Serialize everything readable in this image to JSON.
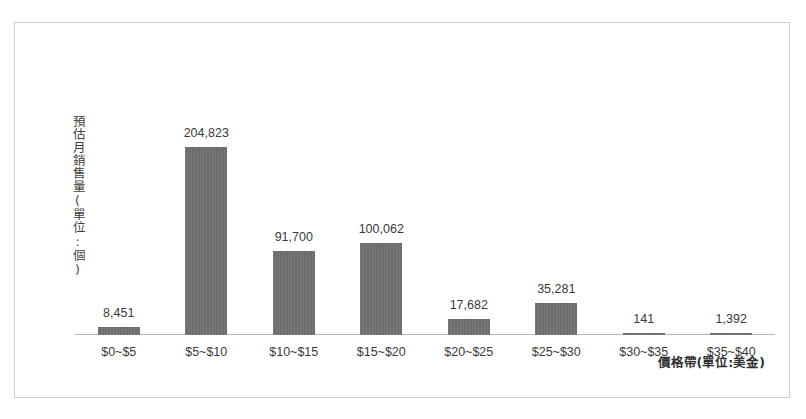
{
  "chart_data": {
    "type": "bar",
    "title": "",
    "subtitle": "",
    "xlabel": "價格帶(單位:美金)",
    "ylabel": "預估月銷售量(單位:個)",
    "categories": [
      "$0~$5",
      "$5~$10",
      "$10~$15",
      "$15~$20",
      "$20~$25",
      "$25~$30",
      "$30~$35",
      "$35~$40"
    ],
    "values": [
      8451,
      204823,
      91700,
      100062,
      17682,
      35281,
      141,
      1392
    ],
    "value_labels": [
      "8,451",
      "204,823",
      "91,700",
      "100,062",
      "17,682",
      "35,281",
      "141",
      "1,392"
    ],
    "ylim": [
      0,
      204823
    ],
    "grid": false,
    "legend": null,
    "axis_ticks_visible": false,
    "series": [
      {
        "name": "預估月銷售量",
        "values": [
          8451,
          204823,
          91700,
          100062,
          17682,
          35281,
          141,
          1392
        ]
      }
    ]
  },
  "style": {
    "bar_color": "#6f6f6f",
    "axis_color": "#b9b9b9",
    "frame_color": "#cfcfcf",
    "text_color": "#3a3a3a",
    "background": "#ffffff"
  }
}
